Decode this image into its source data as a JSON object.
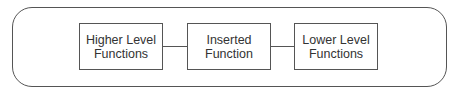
{
  "diagram": {
    "boxes": [
      {
        "label_line1": "Higher Level",
        "label_line2": "Functions"
      },
      {
        "label_line1": "Inserted",
        "label_line2": "Function"
      },
      {
        "label_line1": "Lower Level",
        "label_line2": "Functions"
      }
    ],
    "colors": {
      "stroke": "#555555",
      "text": "#333333",
      "background": "#ffffff"
    }
  }
}
